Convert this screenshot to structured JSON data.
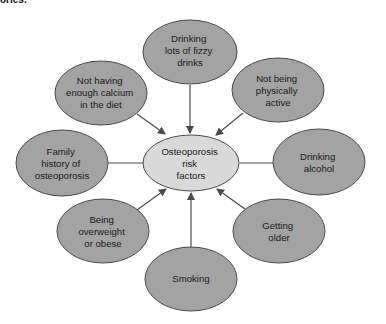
{
  "header": {
    "cut_text": "ories."
  },
  "diagram": {
    "title": "Osteoporosis risk factors",
    "colors": {
      "node_fill": "#a3a3a3",
      "center_fill": "#d9d9d9",
      "stroke": "#4a4a4a",
      "text": "#1a1a1a"
    },
    "center": {
      "lines": [
        "Osteoporosis",
        "risk",
        "factors"
      ]
    },
    "nodes": [
      {
        "id": "fizzy-drinks",
        "lines": [
          "Drinking",
          "lots of fizzy",
          "drinks"
        ]
      },
      {
        "id": "physically-active",
        "lines": [
          "Not being",
          "physically",
          "active"
        ]
      },
      {
        "id": "alcohol",
        "lines": [
          "Drinking",
          "alcohol"
        ]
      },
      {
        "id": "older",
        "lines": [
          "Getting",
          "older"
        ]
      },
      {
        "id": "smoking",
        "lines": [
          "Smoking"
        ]
      },
      {
        "id": "overweight",
        "lines": [
          "Being",
          "overweight",
          "or obese"
        ]
      },
      {
        "id": "family-history",
        "lines": [
          "Family",
          "history of",
          "osteoporosis"
        ]
      },
      {
        "id": "calcium",
        "lines": [
          "Not having",
          "enough calcium",
          "in the diet"
        ]
      }
    ]
  }
}
